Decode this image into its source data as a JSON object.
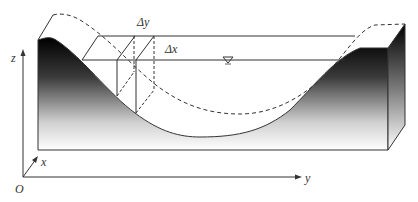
{
  "diagram": {
    "labels": {
      "delta_y": "Δy",
      "delta_x": "Δx",
      "axis_z": "z",
      "axis_x": "x",
      "axis_y": "y",
      "origin": "O"
    },
    "symbols": {
      "water_surface": "free-surface-triangle"
    },
    "colors": {
      "line": "#333333",
      "bank_dark": "#000000",
      "bank_light": "#ffffff"
    }
  }
}
